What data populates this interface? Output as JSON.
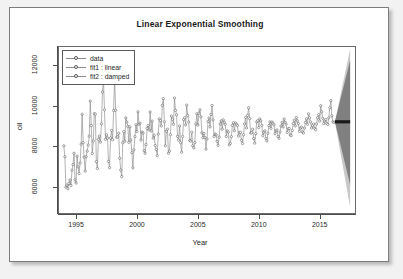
{
  "card": {
    "title": "Linear Exponential Smoothing"
  },
  "legend": {
    "items": [
      {
        "label": "data",
        "marker": "open-circle-line"
      },
      {
        "label": "fit1 : linear",
        "marker": "open-circle-line"
      },
      {
        "label": "fit2 : damped",
        "marker": "open-circle-line"
      }
    ]
  },
  "axes": {
    "x_title": "Year",
    "y_title": "oil",
    "x_ticks": [
      "1995",
      "2000",
      "2005",
      "2010",
      "2015"
    ],
    "y_ticks": [
      "6000",
      "8000",
      "10000",
      "12000"
    ]
  },
  "chart_data": {
    "type": "line",
    "title": "Linear Exponential Smoothing",
    "xlabel": "Year",
    "ylabel": "oil",
    "xlim": [
      1993.6,
      2017.9
    ],
    "ylim": [
      4700,
      12900
    ],
    "x_ticks": [
      1995,
      2000,
      2005,
      2010,
      2015
    ],
    "y_ticks": [
      6000,
      8000,
      10000,
      12000
    ],
    "grid": false,
    "legend_position": "top-left",
    "marker": "open circle",
    "line_color": "#8a8a8a",
    "marker_edge_color": "#4a4a4a",
    "forecast_line_color": "#1a1a1a",
    "pi_inner_color": "#808080",
    "pi_outer_color": "#c8c8c8",
    "series": [
      {
        "name": "data",
        "x_start": 1994.0,
        "x_step": 0.08333,
        "frequency": 12,
        "values": [
          8020,
          7480,
          5980,
          6080,
          5900,
          6160,
          6330,
          6060,
          6810,
          7090,
          7650,
          6340,
          6180,
          7510,
          6980,
          6650,
          7170,
          8100,
          9580,
          8180,
          7460,
          6770,
          7480,
          7760,
          8060,
          8500,
          10230,
          9020,
          7640,
          8260,
          9610,
          9580,
          7240,
          6900,
          8340,
          8500,
          8200,
          9110,
          10680,
          11270,
          9800,
          8340,
          8560,
          8400,
          7250,
          6940,
          8410,
          8780,
          8320,
          9760,
          11390,
          9780,
          8440,
          8460,
          8640,
          7400,
          6820,
          6500,
          8170,
          8720,
          8250,
          9400,
          9190,
          8980,
          8190,
          8960,
          8310,
          7680,
          6930,
          7820,
          8470,
          9060,
          8720,
          9700,
          9080,
          9140,
          8300,
          8700,
          8650,
          7780,
          7650,
          8080,
          8880,
          9020,
          8800,
          9690,
          8750,
          9240,
          8400,
          8540,
          8030,
          7840,
          7530,
          8600,
          9350,
          9270,
          9000,
          10020,
          10350,
          9210,
          8020,
          8740,
          8840,
          7650,
          7760,
          8570,
          9490,
          9330,
          9080,
          10380,
          9770,
          9550,
          8490,
          8300,
          9000,
          8170,
          7700,
          8480,
          9320,
          9410,
          9050,
          10030,
          9520,
          9200,
          8280,
          8250,
          8690,
          8020,
          7920,
          8180,
          9100,
          9600,
          9040,
          9630,
          9800,
          9450,
          8660,
          8420,
          8630,
          8430,
          7850,
          8360,
          9220,
          9390,
          8950,
          9560,
          10010,
          9300,
          8480,
          8600,
          8560,
          8240,
          8040,
          8450,
          9100,
          9250,
          8840,
          9300,
          9180,
          9080,
          8480,
          8760,
          8700,
          8070,
          8140,
          8470,
          9030,
          9160,
          8760,
          9150,
          9080,
          9020,
          8500,
          8680,
          8680,
          8290,
          8130,
          8570,
          9100,
          9420,
          8900,
          9520,
          9900,
          9360,
          8650,
          8660,
          8840,
          8380,
          8150,
          8620,
          9200,
          9260,
          8920,
          9350,
          9250,
          9030,
          8520,
          8690,
          8760,
          8380,
          8260,
          8640,
          9020,
          9200,
          8880,
          9200,
          9130,
          9050,
          8620,
          8760,
          8800,
          8480,
          8390,
          8700,
          9000,
          9180,
          8950,
          9340,
          9180,
          9090,
          8680,
          8860,
          8880,
          8560,
          8520,
          8780,
          9120,
          9280,
          9000,
          9420,
          9250,
          9120,
          8730,
          8900,
          8950,
          8700,
          8650,
          8900,
          9180,
          9350,
          9080,
          9600,
          9400,
          9200,
          8900,
          9020,
          9100,
          8880,
          8820,
          9100,
          9400,
          9560,
          9240,
          10000,
          9700,
          9380,
          9120,
          9250,
          9320,
          9120,
          9080,
          9400,
          9900,
          10250,
          9500,
          9200,
          9180
        ]
      },
      {
        "name": "fit1 : linear",
        "note": "in-sample fitted values overlay the data series",
        "forecast_level": 9220,
        "forecast_x_start": 2016.25,
        "forecast_x_end": 2017.5
      },
      {
        "name": "fit2 : damped",
        "note": "in-sample fitted values overlay the data series",
        "forecast_level": 9190,
        "forecast_x_start": 2016.25,
        "forecast_x_end": 2017.5
      }
    ],
    "forecast": {
      "x_start": 2016.25,
      "x_end": 2017.5,
      "point_forecast": 9205,
      "pi_80_at_end": [
        6100,
        12250
      ],
      "pi_95_at_end": [
        5000,
        12800
      ]
    }
  }
}
